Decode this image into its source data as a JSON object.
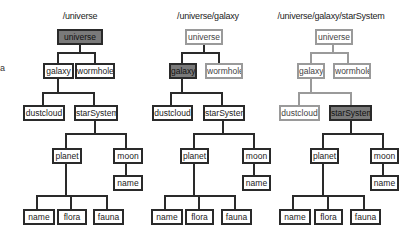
{
  "stray_text": "a",
  "trees": [
    {
      "title": "/universe",
      "selected": "universe",
      "nodes": {
        "universe": "universe",
        "galaxy": "galaxy",
        "wormhole": "wormhole",
        "dustcloud": "dustcloud",
        "starSystem": "starSystem",
        "planet": "planet",
        "moon": "moon",
        "moon_name": "name",
        "name": "name",
        "flora": "flora",
        "fauna": "fauna"
      }
    },
    {
      "title": "/universe/galaxy",
      "selected": "galaxy",
      "nodes": {
        "universe": "universe",
        "galaxy": "galaxy",
        "wormhole": "wormhole",
        "dustcloud": "dustcloud",
        "starSystem": "starSystem",
        "planet": "planet",
        "moon": "moon",
        "moon_name": "name",
        "name": "name",
        "flora": "flora",
        "fauna": "fauna"
      }
    },
    {
      "title": "/universe/galaxy/starSystem",
      "selected": "starSystem",
      "nodes": {
        "universe": "universe",
        "galaxy": "galaxy",
        "wormhole": "wormhole",
        "dustcloud": "dustcloud",
        "starSystem": "starSystem",
        "planet": "planet",
        "moon": "moon",
        "moon_name": "name",
        "name": "name",
        "flora": "flora",
        "fauna": "fauna"
      }
    }
  ],
  "colors": {
    "border": "#2a2a2a",
    "selected_fill": "#7a7a7a",
    "ancestor_border": "#9a9a9a"
  }
}
